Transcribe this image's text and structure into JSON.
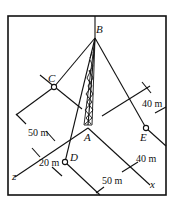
{
  "figure": {
    "points": {
      "A": "A",
      "B": "B",
      "C": "C",
      "D": "D",
      "E": "E"
    },
    "axes": {
      "x": "x",
      "z": "z"
    },
    "dimensions": {
      "c_offset": "50 m",
      "d_offset": "20 m",
      "d_along": "50 m",
      "e_offset": "40 m",
      "e_along": "40 m"
    }
  }
}
